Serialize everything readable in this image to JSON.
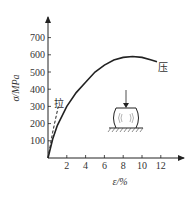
{
  "chart_data": {
    "type": "line",
    "title": "",
    "xlabel": "ε/%",
    "ylabel": "σ/MPa",
    "xlim": [
      0,
      14
    ],
    "ylim": [
      0,
      780
    ],
    "x_ticks": [
      2,
      4,
      6,
      8,
      10,
      12
    ],
    "y_ticks": [
      100,
      200,
      300,
      400,
      500,
      600,
      700
    ],
    "grid": false,
    "legend": "none",
    "series": [
      {
        "name": "压",
        "style": "solid",
        "points": [
          [
            0,
            0
          ],
          [
            0.5,
            110
          ],
          [
            1,
            190
          ],
          [
            2,
            300
          ],
          [
            3,
            380
          ],
          [
            4,
            440
          ],
          [
            5,
            500
          ],
          [
            6,
            540
          ],
          [
            7,
            570
          ],
          [
            8,
            585
          ],
          [
            9,
            590
          ],
          [
            10,
            585
          ],
          [
            11,
            570
          ],
          [
            11.6,
            560
          ]
        ]
      },
      {
        "name": "拉",
        "style": "dashed",
        "points": [
          [
            0,
            0
          ],
          [
            0.5,
            150
          ],
          [
            1.1,
            300
          ]
        ]
      }
    ],
    "annotations": [
      {
        "text": "压",
        "near": "compression curve end"
      },
      {
        "text": "拉",
        "near": "tension curve end"
      },
      {
        "text": "specimen-under-compression-diagram",
        "description": "barrel-shaped specimen compressed by downward arrow on fixed base"
      }
    ]
  },
  "labels": {
    "xlabel": "ε/%",
    "ylabel": "σ/MPa",
    "compression": "压",
    "tension": "拉",
    "x_ticks": [
      "2",
      "4",
      "6",
      "8",
      "10",
      "12"
    ],
    "y_ticks": [
      "100",
      "200",
      "300",
      "400",
      "500",
      "600",
      "700"
    ]
  }
}
